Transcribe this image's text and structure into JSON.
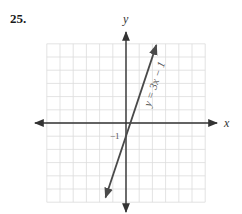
{
  "problem": {
    "number": "25."
  },
  "axes": {
    "x_label": "x",
    "y_label": "y",
    "intercept_label": "−1"
  },
  "colors": {
    "grid": "#d9d9d9",
    "axis": "#333333",
    "line": "#4a4a4a",
    "text": "#333333"
  },
  "chart_data": {
    "type": "line",
    "title": "",
    "xlabel": "x",
    "ylabel": "y",
    "xlim": [
      -6,
      6
    ],
    "ylim": [
      -6,
      6
    ],
    "grid": true,
    "legend": "none",
    "series": [
      {
        "name": "y = 3x − 1",
        "equation": "y = 3x − 1",
        "x": [
          -1.67,
          0,
          0.33,
          2.33
        ],
        "y": [
          -6,
          -1,
          0,
          6
        ]
      }
    ],
    "annotations": [
      {
        "text": "y = 3x − 1",
        "position": "along line, upper right, rotated"
      },
      {
        "text": "−1",
        "position": "y-intercept, left of y-axis"
      }
    ]
  }
}
